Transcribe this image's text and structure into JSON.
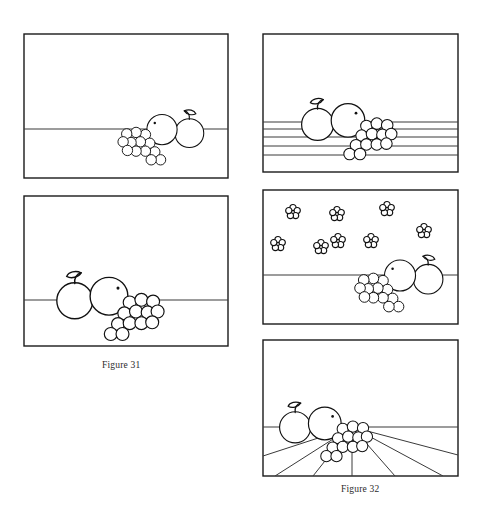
{
  "document": {
    "type": "instructional-drawing-plate",
    "subject": "still life of apple, pear and grapes shown against four different background treatments",
    "background_color": "#ffffff",
    "ink_color": "#111111",
    "width": 477,
    "height": 508
  },
  "captions": [
    {
      "id": "figure-31",
      "text": "Figure 31",
      "x": 102,
      "y": 360
    },
    {
      "id": "figure-32",
      "text": "Figure 32",
      "x": 341,
      "y": 484
    }
  ],
  "panels": [
    {
      "id": "panel-top-left",
      "name": "plain-horizon-panel",
      "label": "Still life on plain horizon line",
      "frame": {
        "x": 24,
        "y": 34,
        "w": 204,
        "h": 144
      },
      "background": "plain",
      "horizon_y": 129,
      "still_life": {
        "cx": 162,
        "cy": 131,
        "scale": 0.72,
        "flip": true
      },
      "decor_count": 0
    },
    {
      "id": "panel-top-right",
      "name": "horizontal-stripes-panel",
      "label": "Still life on horizontal striped background",
      "frame": {
        "x": 263,
        "y": 34,
        "w": 195,
        "h": 138
      },
      "background": "horizontal-lines",
      "horizon_y": 122,
      "stripe_ys": [
        122,
        129,
        137,
        146,
        155
      ],
      "still_life": {
        "cx": 345,
        "cy": 122,
        "scale": 0.8,
        "flip": false
      },
      "decor_count": 0
    },
    {
      "id": "panel-middle-left",
      "name": "figure-31-panel",
      "label": "Figure 31 - still life on plain horizon line",
      "frame": {
        "x": 24,
        "y": 196,
        "w": 204,
        "h": 150
      },
      "background": "plain",
      "horizon_y": 300,
      "still_life": {
        "cx": 95,
        "cy": 300,
        "scale": 0.9,
        "flip": false
      },
      "decor_count": 0
    },
    {
      "id": "panel-middle-right",
      "name": "flower-wallpaper-panel",
      "label": "Still life against flower-patterned wallpaper",
      "frame": {
        "x": 263,
        "y": 190,
        "w": 195,
        "h": 134
      },
      "background": "flowers",
      "horizon_y": 275,
      "still_life": {
        "cx": 400,
        "cy": 276,
        "scale": 0.74,
        "flip": true
      },
      "decor_count": 8,
      "flowers": [
        {
          "x": 293,
          "y": 212,
          "r": 4.0
        },
        {
          "x": 337,
          "y": 214,
          "r": 4.0
        },
        {
          "x": 387,
          "y": 209,
          "r": 4.0
        },
        {
          "x": 424,
          "y": 231,
          "r": 4.0
        },
        {
          "x": 338,
          "y": 241,
          "r": 3.6
        },
        {
          "x": 278,
          "y": 244,
          "r": 3.6
        },
        {
          "x": 321,
          "y": 247,
          "r": 3.4
        },
        {
          "x": 371,
          "y": 241,
          "r": 3.4
        }
      ]
    },
    {
      "id": "panel-bottom-right",
      "name": "figure-32-panel",
      "label": "Figure 32 - still life on perspective floorboards",
      "frame": {
        "x": 263,
        "y": 340,
        "w": 195,
        "h": 136
      },
      "background": "perspective-floor",
      "horizon_y": 427,
      "vanishing_point": {
        "x": 352,
        "y": 427
      },
      "floor_line_count": 6,
      "still_life": {
        "cx": 304,
        "cy": 427,
        "scale": 0.78,
        "flip": false
      }
    }
  ],
  "still_life_elements": {
    "apple": {
      "shape": "circle",
      "has_stem": true,
      "has_leaf": true
    },
    "pear": {
      "shape": "circle",
      "has_seed_dot": true
    },
    "grapes": {
      "shape": "cluster-of-circles",
      "berry_count": 12
    }
  }
}
